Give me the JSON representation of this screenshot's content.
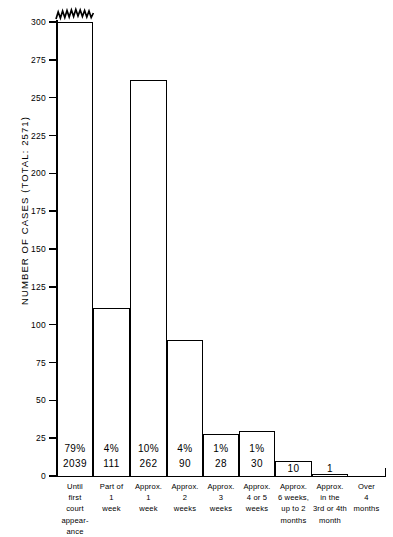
{
  "chart_data": {
    "type": "bar",
    "title": "",
    "xlabel": "",
    "ylabel": "NUMBER OF CASES   (TOTAL: 2571)",
    "ylim": [
      0,
      300
    ],
    "yticks": [
      0,
      25,
      50,
      75,
      100,
      125,
      150,
      175,
      200,
      225,
      250,
      275,
      300
    ],
    "grid": false,
    "legend": null,
    "axis_break": {
      "series_index": 0,
      "note": "first bar drawn with zigzag break at top of axis; true value 2039 exceeds scale"
    },
    "categories": [
      "Until first court appearance",
      "Part of 1 week",
      "Approx. 1 week",
      "Approx. 2 weeks",
      "Approx. 3 weeks",
      "Approx. 4 or 5 weeks",
      "Approx. 6 weeks, up to 2 months",
      "Approx. in the 3rd or 4th month",
      "Over 4 months"
    ],
    "values": [
      2039,
      111,
      262,
      90,
      28,
      30,
      10,
      1,
      0
    ],
    "percents": [
      "79%",
      "4%",
      "10%",
      "4%",
      "1%",
      "1%",
      "",
      "",
      ""
    ],
    "count_labels": [
      "2039",
      "111",
      "262",
      "90",
      "28",
      "30",
      "10",
      "1",
      ""
    ]
  },
  "y_axis": {
    "title": "NUMBER OF CASES   (TOTAL: 2571)",
    "ticks": [
      {
        "label": "300"
      },
      {
        "label": "275"
      },
      {
        "label": "250"
      },
      {
        "label": "225"
      },
      {
        "label": "200"
      },
      {
        "label": "175"
      },
      {
        "label": "150"
      },
      {
        "label": "125"
      },
      {
        "label": "100"
      },
      {
        "label": "75"
      },
      {
        "label": "50"
      },
      {
        "label": "25"
      },
      {
        "label": "0"
      }
    ]
  },
  "bars": [
    {
      "pct": "79%",
      "count": "2039",
      "cat_lines": [
        "Until",
        "first",
        "court",
        "appear-",
        "ance"
      ]
    },
    {
      "pct": "4%",
      "count": "111",
      "cat_lines": [
        "Part of",
        "1",
        "week"
      ]
    },
    {
      "pct": "10%",
      "count": "262",
      "cat_lines": [
        "Approx.",
        "1",
        "week"
      ]
    },
    {
      "pct": "4%",
      "count": "90",
      "cat_lines": [
        "Approx.",
        "2",
        "weeks"
      ]
    },
    {
      "pct": "1%",
      "count": "28",
      "cat_lines": [
        "Approx.",
        "3",
        "weeks"
      ]
    },
    {
      "pct": "1%",
      "count": "30",
      "cat_lines": [
        "Approx.",
        "4 or 5",
        "weeks"
      ]
    },
    {
      "pct": "",
      "count": "10",
      "cat_lines": [
        "Approx.",
        "6 weeks,",
        "up to 2",
        "months"
      ]
    },
    {
      "pct": "",
      "count": "1",
      "cat_lines": [
        "Approx.",
        "in the",
        "3rd or 4th",
        "month"
      ]
    },
    {
      "pct": "",
      "count": "",
      "cat_lines": [
        "Over",
        "4",
        "months"
      ]
    }
  ]
}
